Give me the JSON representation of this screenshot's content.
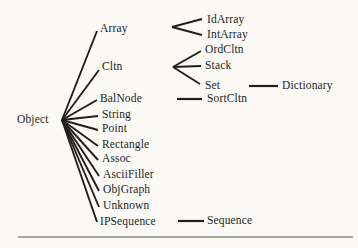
{
  "figure": {
    "type": "class-hierarchy-tree",
    "background_color": "#fbfaf6",
    "ink_color": "#221f1b",
    "separator_color": "#8b8b83",
    "root_label": "Object",
    "nodes": [
      {
        "id": "object",
        "label": "Object",
        "x": 17,
        "y": 120
      },
      {
        "id": "array",
        "label": "Array",
        "x": 100,
        "y": 29
      },
      {
        "id": "cltn",
        "label": "Cltn",
        "x": 102,
        "y": 67
      },
      {
        "id": "balnode",
        "label": "BalNode",
        "x": 100,
        "y": 99
      },
      {
        "id": "string",
        "label": "String",
        "x": 102,
        "y": 115
      },
      {
        "id": "point",
        "label": "Point",
        "x": 102,
        "y": 129
      },
      {
        "id": "rectangle",
        "label": "Rectangle",
        "x": 102,
        "y": 145
      },
      {
        "id": "assoc",
        "label": "Assoc",
        "x": 102,
        "y": 159
      },
      {
        "id": "asciifiller",
        "label": "AsciiFiller",
        "x": 103,
        "y": 175
      },
      {
        "id": "objgraph",
        "label": "ObjGraph",
        "x": 103,
        "y": 190
      },
      {
        "id": "unknown",
        "label": "Unknown",
        "x": 103,
        "y": 206
      },
      {
        "id": "ipsequence",
        "label": "IPSequence",
        "x": 100,
        "y": 222
      },
      {
        "id": "idarray",
        "label": "IdArray",
        "x": 207,
        "y": 20
      },
      {
        "id": "intarray",
        "label": "IntArray",
        "x": 207,
        "y": 35
      },
      {
        "id": "ordcltn",
        "label": "OrdCltn",
        "x": 205,
        "y": 50
      },
      {
        "id": "stack",
        "label": "Stack",
        "x": 205,
        "y": 66
      },
      {
        "id": "set",
        "label": "Set",
        "x": 205,
        "y": 86
      },
      {
        "id": "sortcltn",
        "label": "SortCltn",
        "x": 207,
        "y": 99
      },
      {
        "id": "dictionary",
        "label": "Dictionary",
        "x": 282,
        "y": 86
      },
      {
        "id": "sequence",
        "label": "Sequence",
        "x": 207,
        "y": 221
      }
    ],
    "edges": [
      {
        "name": "object-to-array",
        "x1": 62,
        "y1": 120,
        "x2": 97,
        "y2": 31,
        "w": 1.9
      },
      {
        "name": "object-to-cltn",
        "x1": 62,
        "y1": 120,
        "x2": 99,
        "y2": 70,
        "w": 1.9
      },
      {
        "name": "object-to-balnode",
        "x1": 62,
        "y1": 120,
        "x2": 97,
        "y2": 100,
        "w": 1.9
      },
      {
        "name": "object-to-string",
        "x1": 62,
        "y1": 120,
        "x2": 98,
        "y2": 116,
        "w": 1.9
      },
      {
        "name": "object-to-point",
        "x1": 62,
        "y1": 120,
        "x2": 98,
        "y2": 130,
        "w": 1.9
      },
      {
        "name": "object-to-rectangle",
        "x1": 62,
        "y1": 120,
        "x2": 98,
        "y2": 146,
        "w": 1.9
      },
      {
        "name": "object-to-assoc",
        "x1": 62,
        "y1": 120,
        "x2": 98,
        "y2": 160,
        "w": 1.9
      },
      {
        "name": "object-to-asciifiller",
        "x1": 62,
        "y1": 120,
        "x2": 99,
        "y2": 176,
        "w": 1.9
      },
      {
        "name": "object-to-objgraph",
        "x1": 62,
        "y1": 120,
        "x2": 99,
        "y2": 191,
        "w": 1.9
      },
      {
        "name": "object-to-unknown",
        "x1": 62,
        "y1": 120,
        "x2": 99,
        "y2": 207,
        "w": 1.9
      },
      {
        "name": "object-to-ipsequence",
        "x1": 62,
        "y1": 120,
        "x2": 97,
        "y2": 222,
        "w": 1.9
      },
      {
        "name": "array-to-idarray",
        "x1": 172,
        "y1": 27,
        "x2": 202,
        "y2": 19,
        "w": 1.9
      },
      {
        "name": "array-to-intarray",
        "x1": 172,
        "y1": 27,
        "x2": 202,
        "y2": 35,
        "w": 1.9
      },
      {
        "name": "cltn-to-ordcltn",
        "x1": 173,
        "y1": 67,
        "x2": 201,
        "y2": 51,
        "w": 1.9
      },
      {
        "name": "cltn-to-stack",
        "x1": 173,
        "y1": 67,
        "x2": 201,
        "y2": 66,
        "w": 1.9
      },
      {
        "name": "cltn-to-set",
        "x1": 173,
        "y1": 67,
        "x2": 200,
        "y2": 84,
        "w": 1.9
      },
      {
        "name": "balnode-to-sortcltn",
        "x1": 177,
        "y1": 99,
        "x2": 202,
        "y2": 99,
        "w": 2.2
      },
      {
        "name": "set-to-dictionary",
        "x1": 249,
        "y1": 86,
        "x2": 278,
        "y2": 86,
        "w": 2.2
      },
      {
        "name": "ipsequence-to-sequence",
        "x1": 178,
        "y1": 221,
        "x2": 204,
        "y2": 221,
        "w": 2.2
      }
    ],
    "separator": {
      "x1": 18,
      "y1": 237,
      "x2": 353,
      "y2": 237,
      "w": 1.6
    }
  }
}
